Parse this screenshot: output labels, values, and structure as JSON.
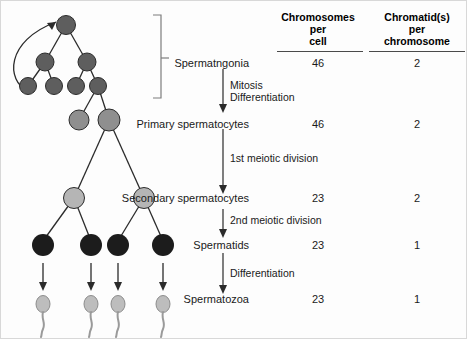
{
  "columns": {
    "chromosomes_header": "Chromosomes\nper\ncell",
    "chromosomes_header_lines": [
      "Chromosomes",
      "per",
      "cell"
    ],
    "chromatids_header": "Chromatid(s)\nper\nchromosome",
    "chromatids_header_lines": [
      "Chromatid(s)",
      "per",
      "chromosome"
    ]
  },
  "stages": [
    {
      "label": "Spermatngonia",
      "chromosomes_per_cell": "46",
      "chromatids_per_chromosome": "2"
    },
    {
      "label": "Primary spermatocytes",
      "chromosomes_per_cell": "46",
      "chromatids_per_chromosome": "2"
    },
    {
      "label": "Secondary spermatocytes",
      "chromosomes_per_cell": "23",
      "chromatids_per_chromosome": "2"
    },
    {
      "label": "Spermatids",
      "chromosomes_per_cell": "23",
      "chromatids_per_chromosome": "1"
    },
    {
      "label": "Spermatozoa",
      "chromosomes_per_cell": "23",
      "chromatids_per_chromosome": "1"
    }
  ],
  "transitions": [
    {
      "line1": "Mitosis",
      "line2": "Differentiation"
    },
    {
      "line1": "1st meiotic division",
      "line2": ""
    },
    {
      "line1": "2nd meiotic division",
      "line2": ""
    },
    {
      "line1": "Differentiation",
      "line2": ""
    }
  ],
  "colors": {
    "spermatogonia": "#5e5e5e",
    "primary_spermatocyte": "#8f8f8f",
    "secondary_spermatocyte": "#b5b5b5",
    "spermatid": "#1c1c1c",
    "spermatozoa_head": "#bdbdbd",
    "spermatozoa_tail": "#9a9a9a",
    "stroke": "#2b2b2b",
    "text": "#1a1a1a",
    "rule": "#4a4a4a"
  }
}
